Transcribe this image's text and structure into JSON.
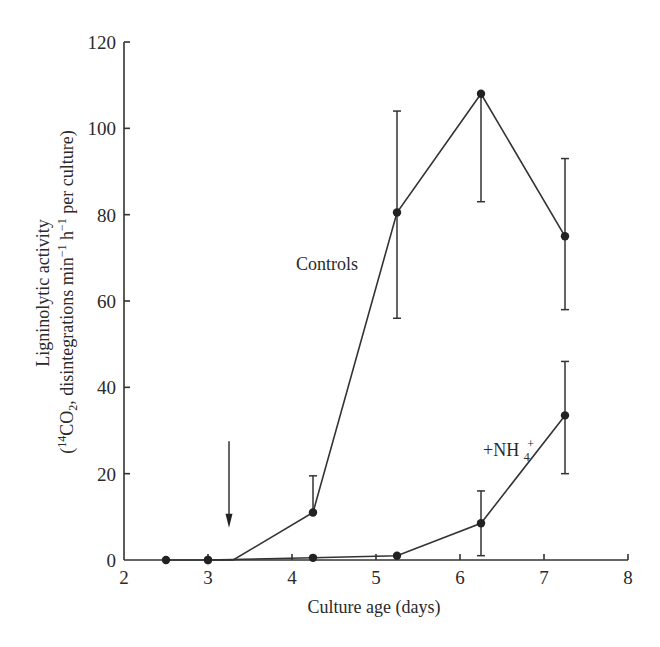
{
  "chart_data": {
    "type": "line",
    "title": "",
    "xlabel": "Culture age (days)",
    "ylabel_line1": "Ligninolytic activity",
    "ylabel_line2_parts": {
      "open": "(",
      "sup14": "14",
      "co": "CO",
      "sub2": "2",
      "mid": ", disintegrations min",
      "supm1a": "−1",
      "h": " h",
      "supm1b": "−1",
      "tail": " per culture)"
    },
    "xlim": [
      2,
      8
    ],
    "ylim": [
      0,
      120
    ],
    "xticks": [
      2,
      3,
      4,
      5,
      6,
      7,
      8
    ],
    "yticks": [
      0,
      20,
      40,
      60,
      80,
      100,
      120
    ],
    "grid": false,
    "series": [
      {
        "name": "Controls",
        "x": [
          2.5,
          3.0,
          4.25,
          5.25,
          6.25,
          7.25
        ],
        "y": [
          0,
          0,
          11,
          80.5,
          108,
          75
        ],
        "err_low": [
          null,
          null,
          null,
          56,
          83,
          58
        ],
        "err_high": [
          null,
          null,
          19.5,
          104,
          null,
          93
        ],
        "path_vertices": [
          [
            2.5,
            0
          ],
          [
            3.0,
            0
          ],
          [
            3.3,
            0
          ],
          [
            4.25,
            11
          ],
          [
            5.25,
            80.5
          ],
          [
            6.25,
            108
          ],
          [
            7.25,
            75
          ]
        ]
      },
      {
        "name": "+NH4+",
        "x": [
          3.0,
          4.25,
          5.25,
          6.25,
          7.25
        ],
        "y": [
          0,
          0.5,
          1,
          8.5,
          33.5
        ],
        "err_low": [
          null,
          null,
          null,
          1,
          20
        ],
        "err_high": [
          null,
          null,
          null,
          16,
          46
        ],
        "path_vertices": [
          [
            3.0,
            0
          ],
          [
            4.25,
            0.5
          ],
          [
            5.25,
            1
          ],
          [
            6.25,
            8.5
          ],
          [
            7.25,
            33.5
          ]
        ]
      }
    ],
    "annotations": [
      {
        "text": "Controls",
        "near_series": "Controls"
      },
      {
        "text_main": "+NH",
        "text_sub": "4",
        "text_sup": "+",
        "near_series": "+NH4+"
      }
    ],
    "arrow": {
      "x": 3.25,
      "y_from": 27.5,
      "y_to": 7.5,
      "meaning": "time of NH4+ addition"
    }
  }
}
